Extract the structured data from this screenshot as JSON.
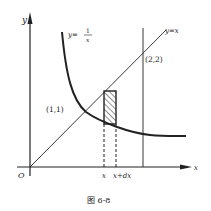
{
  "figure": {
    "caption": "图 6-8",
    "axes": {
      "x_label": "x",
      "y_label": "y",
      "origin_label": "O"
    },
    "curves": [
      {
        "name": "hyperbola",
        "label_lhs": "y=",
        "label_num": "1",
        "label_den": "x",
        "equation": "y = 1/x"
      },
      {
        "name": "line",
        "label": "y=x",
        "equation": "y = x"
      },
      {
        "name": "vertical-line",
        "equation": "x = 2"
      }
    ],
    "points": [
      {
        "label": "(1,1)",
        "x": 1,
        "y": 1
      },
      {
        "label": "(2,2)",
        "x": 2,
        "y": 2
      }
    ],
    "strip": {
      "left_label": "x",
      "right_label": "x+dx",
      "pattern": "hatched"
    },
    "colors": {
      "ink": "#222222",
      "background": "#ffffff"
    }
  }
}
